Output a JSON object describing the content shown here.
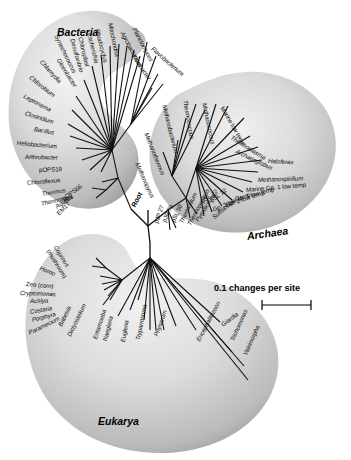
{
  "figure": {
    "root_label": "Root",
    "scale_label": "0.1 changes per site",
    "background_color": "#ffffff",
    "line_color": "#101010",
    "lobe_fill_light": "#e9e9e9",
    "lobe_fill_mid": "#c8c8c8",
    "lobe_fill_dark": "#9a9a9a"
  },
  "domains": [
    {
      "id": "bacteria",
      "label": "Bacteria"
    },
    {
      "id": "archaea",
      "label": "Archaea"
    },
    {
      "id": "eukarya",
      "label": "Eukarya"
    }
  ],
  "bacteria_taxa": [
    {
      "name": "Mitochondria"
    },
    {
      "name": "Agrobacterium"
    },
    {
      "name": "Planctomyces"
    },
    {
      "name": "Flexibacter"
    },
    {
      "name": "Flavobacterium"
    },
    {
      "name": "Rhodocyclus"
    },
    {
      "name": "Escherichia"
    },
    {
      "name": "Chloroplast"
    },
    {
      "name": "Desulfovibrio"
    },
    {
      "name": "Synechococcus"
    },
    {
      "name": "Gloeobacter"
    },
    {
      "name": "Chlamydia"
    },
    {
      "name": "Chlorobium"
    },
    {
      "name": "Leptonema"
    },
    {
      "name": "Clostridium"
    },
    {
      "name": "Bacillus"
    },
    {
      "name": "Heliobacterium"
    },
    {
      "name": "Arthrobacter"
    },
    {
      "name": "pOPS19"
    },
    {
      "name": "Chloroflexus"
    },
    {
      "name": "Thermus"
    },
    {
      "name": "Thermotoga"
    },
    {
      "name": "pOPS66"
    },
    {
      "name": "Aquifex"
    },
    {
      "name": "EM17"
    }
  ],
  "archaea_taxa": [
    {
      "name": "Methanopyrus"
    },
    {
      "name": "Methanothermus"
    },
    {
      "name": "Methanobacterium"
    },
    {
      "name": "Thermococcus"
    },
    {
      "name": "Methanococcus"
    },
    {
      "name": "Marine low temp"
    },
    {
      "name": "Thermoplasma"
    },
    {
      "name": "Archaeoglobus"
    },
    {
      "name": "Haloferax"
    },
    {
      "name": "Methanospirillum"
    },
    {
      "name": "Marine Gp. 1 low temp"
    },
    {
      "name": "Gp. 1 low temp"
    },
    {
      "name": "Gp. 2 low temp"
    },
    {
      "name": "Gp. 3 low temp"
    },
    {
      "name": "pSL 22"
    },
    {
      "name": "pSL 12"
    },
    {
      "name": "Sulfolobus"
    },
    {
      "name": "Pyrodictium"
    },
    {
      "name": "Thermoproteus"
    },
    {
      "name": "Thermofilum"
    },
    {
      "name": "pSL 50"
    },
    {
      "name": "pJP 78"
    },
    {
      "name": "pJP 27"
    }
  ],
  "eukarya_taxa": [
    {
      "name": "Coprinus"
    },
    {
      "name": "(mushroom)"
    },
    {
      "name": "Homo"
    },
    {
      "name": "Zea (corn)"
    },
    {
      "name": "Cryptomonas"
    },
    {
      "name": "Achlya"
    },
    {
      "name": "Costaria"
    },
    {
      "name": "Porphyra"
    },
    {
      "name": "Paramecium"
    },
    {
      "name": "Babesia"
    },
    {
      "name": "Dictyostelium"
    },
    {
      "name": "Entamoeba"
    },
    {
      "name": "Naegleria"
    },
    {
      "name": "Euglena"
    },
    {
      "name": "Trypanosoma"
    },
    {
      "name": "Physarum"
    },
    {
      "name": "Encephalitozoon"
    },
    {
      "name": "Vairimorpha"
    },
    {
      "name": "Trichomonas"
    },
    {
      "name": "Giardia"
    }
  ]
}
